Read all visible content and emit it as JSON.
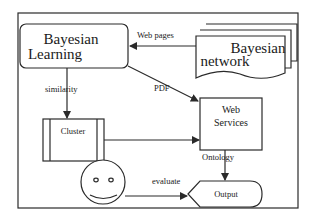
{
  "diagram": {
    "nodes": {
      "bayesian_learning": {
        "line1": "Bayesian",
        "line2": "Learning"
      },
      "bayesian_network": {
        "line1": "Bayesian",
        "line2": "network"
      },
      "web_services": {
        "line1": "Web",
        "line2": "Services"
      },
      "cluster": {
        "label": "Cluster"
      },
      "output": {
        "label": "Output"
      },
      "user": {
        "icon": "smiley-face-icon"
      }
    },
    "edges": {
      "web_pages": "Web pages",
      "pdf": "PDF",
      "similarity": "similarity",
      "ontology": "Ontology",
      "evaluate": "evaluate"
    },
    "colors": {
      "line": "#2a2a2a",
      "background": "#ffffff"
    }
  }
}
